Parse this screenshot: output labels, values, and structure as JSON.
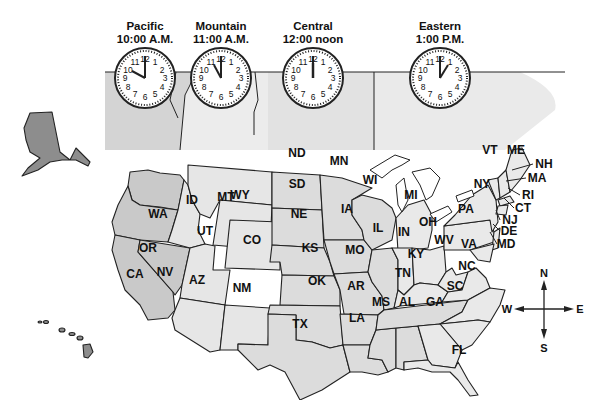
{
  "clocks": [
    {
      "zone": "Pacific",
      "time": "10:00 A.M.",
      "hour": 10,
      "minute": 0
    },
    {
      "zone": "Mountain",
      "time": "11:00 A.M.",
      "hour": 11,
      "minute": 0
    },
    {
      "zone": "Central",
      "time": "12:00 noon",
      "hour": 12,
      "minute": 0
    },
    {
      "zone": "Eastern",
      "time": "1:00 P.M.",
      "hour": 1,
      "minute": 0
    }
  ],
  "clock_numbers": [
    "12",
    "1",
    "2",
    "3",
    "4",
    "5",
    "6",
    "7",
    "8",
    "9",
    "10",
    "11"
  ],
  "states": {
    "WA": "WA",
    "OR": "OR",
    "CA": "CA",
    "NV": "NV",
    "ID": "ID",
    "MT": "MT",
    "WY": "WY",
    "UT": "UT",
    "CO": "CO",
    "AZ": "AZ",
    "NM": "NM",
    "ND": "ND",
    "SD": "SD",
    "NE": "NE",
    "KS": "KS",
    "OK": "OK",
    "TX": "TX",
    "MN": "MN",
    "IA": "IA",
    "MO": "MO",
    "AR": "AR",
    "LA": "LA",
    "WI": "WI",
    "IL": "IL",
    "MS": "MS",
    "AL": "AL",
    "TN": "TN",
    "KY": "KY",
    "MI": "MI",
    "IN": "IN",
    "OH": "OH",
    "GA": "GA",
    "FL": "FL",
    "SC": "SC",
    "NC": "NC",
    "VA": "VA",
    "WV": "WV",
    "PA": "PA",
    "NY": "NY",
    "VT": "VT",
    "ME": "ME",
    "NH": "NH",
    "MA": "MA",
    "RI": "RI",
    "CT": "CT",
    "NJ": "NJ",
    "DE": "DE",
    "MD": "MD"
  },
  "compass": {
    "n": "N",
    "s": "S",
    "e": "E",
    "w": "W"
  },
  "colors": {
    "pacific": "#c9c9c9",
    "mountain": "#e6e6e6",
    "central": "#dcdcdc",
    "eastern": "#e9e9e9",
    "alaska_hawaii": "#8d8d8d",
    "border": "#222222"
  }
}
